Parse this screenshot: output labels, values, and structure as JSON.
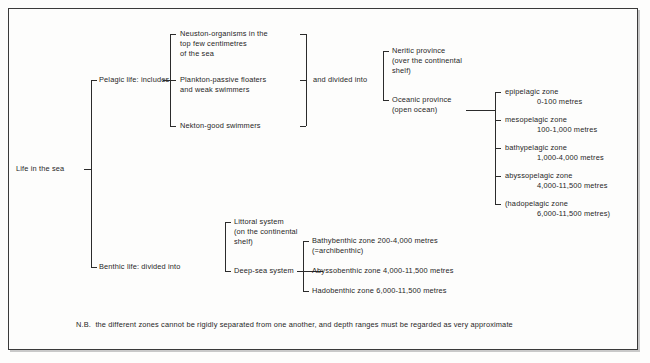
{
  "figure": {
    "root": {
      "label": "Life in the sea"
    },
    "branches": [
      {
        "label": "Pelagic life: includes"
      },
      {
        "label": "Benthic life: divided into"
      }
    ],
    "pelagic_groups": [
      {
        "label": "Neuston-organisms in the\ntop few centimetres\nof the sea"
      },
      {
        "label": "Plankton-passive floaters\nand weak swimmers"
      },
      {
        "label": "Nekton-good swimmers"
      }
    ],
    "divided_connector": {
      "label": "and divided into"
    },
    "provinces": [
      {
        "label": "Neritic province\n(over the continental\nshelf)"
      },
      {
        "label": "Oceanic province\n(open ocean)"
      }
    ],
    "pelagic_zones": [
      {
        "name": "epipelagic zone",
        "depth": "0-100 metres"
      },
      {
        "name": "mesopelagic zone",
        "depth": "100-1,000 metres"
      },
      {
        "name": "bathypelagic zone",
        "depth": "1,000-4,000 metres"
      },
      {
        "name": "abyssopelagic zone",
        "depth": "4,000-11,500 metres"
      },
      {
        "name": "(hadopelagic zone",
        "depth": "6,000-11,500 metres)"
      }
    ],
    "benthic_systems": [
      {
        "label": "Littoral system\n(on the continental\nshelf)"
      },
      {
        "label": "Deep-sea system"
      }
    ],
    "benthic_zones": [
      {
        "label": "Bathybenthic zone 200-4,000 metres\n(=archibenthic)"
      },
      {
        "label": "Abyssobenthic zone 4,000-11,500 metres"
      },
      {
        "label": "Hadobenthic zone 6,000-11,500 metres"
      }
    ],
    "footnote": "N.B.  the different zones cannot be rigidly separated from one another, and depth ranges must be regarded as very approximate"
  },
  "colors": {
    "ink": "#1f1f1f",
    "line": "#2b2b2b",
    "frame": "#3a3a3a",
    "paper": "#fdfdfc"
  }
}
